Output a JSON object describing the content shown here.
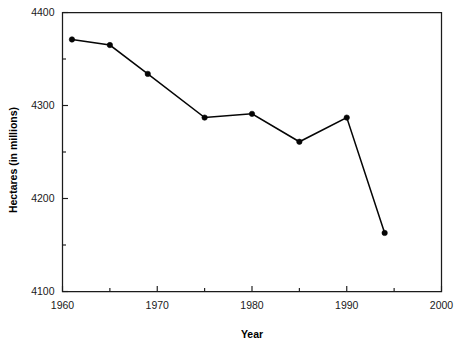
{
  "chart_data": {
    "type": "line",
    "title": "",
    "xlabel": "Year",
    "ylabel": "Hectares (in millions)",
    "xlim": [
      1960,
      2000
    ],
    "ylim": [
      4100,
      4400
    ],
    "grid": false,
    "legend": "none",
    "x_ticks_major": [
      1960,
      1970,
      1980,
      1990,
      2000
    ],
    "x_ticks_minor": [
      1965,
      1975,
      1985,
      1995
    ],
    "x_tick_labels": [
      "1960",
      "1970",
      "1980",
      "1990",
      "2000"
    ],
    "y_ticks_major": [
      4100,
      4200,
      4300,
      4400
    ],
    "y_ticks_minor": [
      4150,
      4250,
      4350
    ],
    "y_tick_labels": [
      "4100",
      "4200",
      "4300",
      "4400"
    ],
    "series": [
      {
        "name": "Hectares",
        "marker": "filled-circle",
        "color": "#050505",
        "x": [
          1961,
          1965,
          1969,
          1975,
          1980,
          1985,
          1990,
          1994
        ],
        "values": [
          4371,
          4365,
          4334,
          4287,
          4291,
          4261,
          4287,
          4163
        ]
      }
    ]
  },
  "axes": {
    "x_title": "Year",
    "y_title": "Hectares (in millions)"
  }
}
